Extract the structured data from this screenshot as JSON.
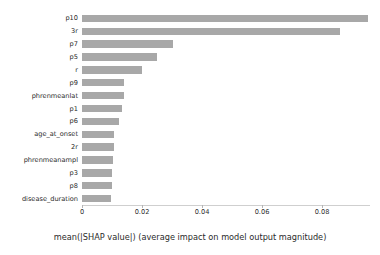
{
  "chart_data": {
    "type": "bar",
    "orientation": "horizontal",
    "title": "",
    "xlabel": "mean(|SHAP value|) (average impact on model output magnitude)",
    "ylabel": "",
    "xlim": [
      0,
      0.096
    ],
    "ylim": null,
    "grid": false,
    "legend": null,
    "bar_color": "#a8a8a8",
    "background_color": "#ffffff",
    "xticks": [
      0,
      0.02,
      0.04,
      0.06,
      0.08
    ],
    "xtick_labels": [
      "0",
      "0.02",
      "0.04",
      "0.06",
      "0.08"
    ],
    "categories": [
      "p10",
      "3r",
      "p7",
      "p5",
      "r",
      "p9",
      "phrenmeanlat",
      "p1",
      "p6",
      "age_at_onset",
      "2r",
      "phrenmeanampl",
      "p3",
      "p8",
      "disease_duration"
    ],
    "values": [
      0.0953,
      0.086,
      0.0303,
      0.025,
      0.02,
      0.0141,
      0.014,
      0.0134,
      0.0123,
      0.0108,
      0.0105,
      0.0103,
      0.0101,
      0.01,
      0.0095
    ],
    "series": [
      {
        "name": "mean(|SHAP value|)",
        "values": [
          0.0953,
          0.086,
          0.0303,
          0.025,
          0.02,
          0.0141,
          0.014,
          0.0134,
          0.0123,
          0.0108,
          0.0105,
          0.0103,
          0.0101,
          0.01,
          0.0095
        ]
      }
    ]
  }
}
